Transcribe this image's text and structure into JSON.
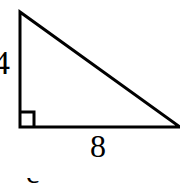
{
  "figure": {
    "type": "right-triangle-diagram",
    "background_color": "#ffffff",
    "stroke_color": "#000000",
    "stroke_width": 3,
    "vertices": {
      "apex": [
        20,
        12
      ],
      "right_angle": [
        20,
        127
      ],
      "base_right": [
        180,
        127
      ]
    },
    "right_angle_marker": {
      "size": 15,
      "visible": true
    },
    "labels": {
      "vertical_leg": "4",
      "horizontal_leg": "8"
    },
    "caption": {
      "partial_text": "c =",
      "note": "clipped at bottom edge"
    }
  }
}
